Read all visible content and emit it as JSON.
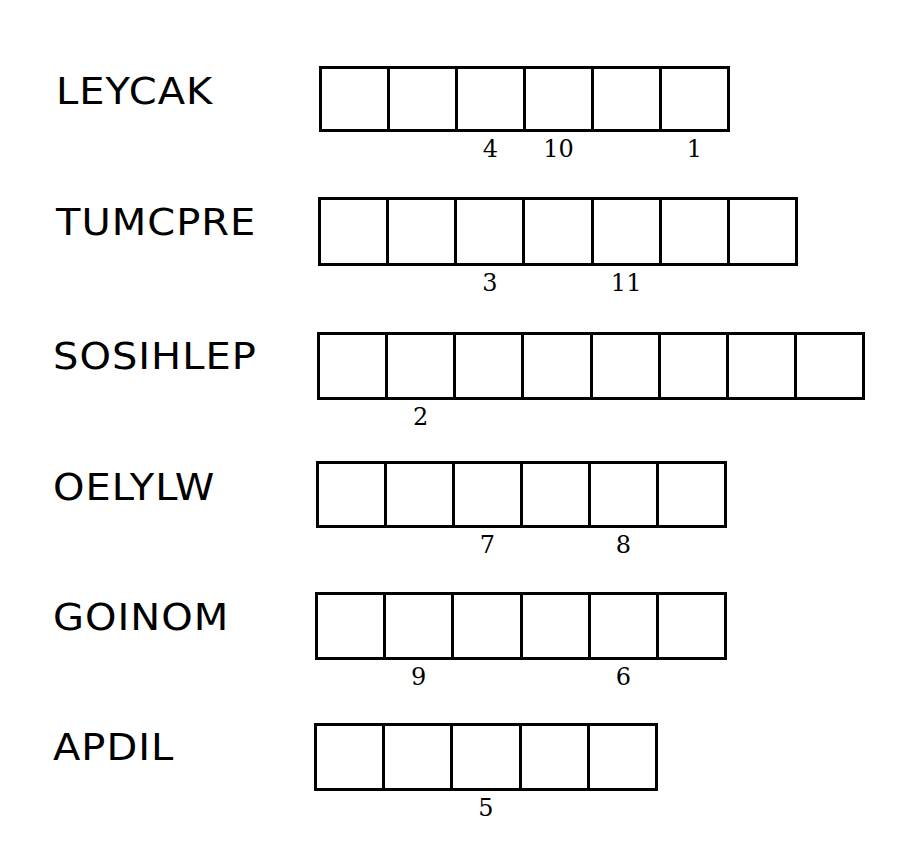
{
  "puzzle": {
    "type": "word-scramble",
    "rows": [
      {
        "scrambled_word": "LEYCAK",
        "cell_count": 6,
        "cell_numbers": [
          "",
          "",
          "4",
          "10",
          "",
          "1"
        ]
      },
      {
        "scrambled_word": "TUMCPRE",
        "cell_count": 7,
        "cell_numbers": [
          "",
          "",
          "3",
          "",
          "11",
          "",
          ""
        ]
      },
      {
        "scrambled_word": "SOSIHLEP",
        "cell_count": 8,
        "cell_numbers": [
          "",
          "2",
          "",
          "",
          "",
          "",
          "",
          ""
        ]
      },
      {
        "scrambled_word": "OELYLW",
        "cell_count": 6,
        "cell_numbers": [
          "",
          "",
          "7",
          "",
          "8",
          ""
        ]
      },
      {
        "scrambled_word": "GOINOM",
        "cell_count": 6,
        "cell_numbers": [
          "",
          "9",
          "",
          "",
          "6",
          ""
        ]
      },
      {
        "scrambled_word": "APDIL",
        "cell_count": 5,
        "cell_numbers": [
          "",
          "",
          "5",
          "",
          ""
        ]
      }
    ]
  }
}
